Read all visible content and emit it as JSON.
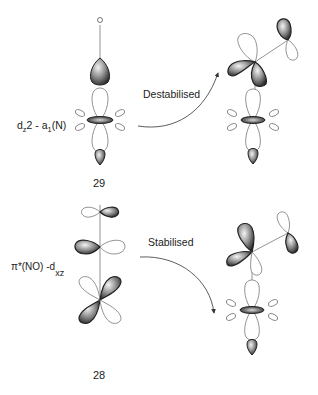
{
  "diagram": {
    "top": {
      "atom_label": "O",
      "orbital_label": {
        "main": "d",
        "main_sub": "z",
        "mid": "2 - a",
        "mid_sub": "1",
        "tail": "(N)"
      },
      "compound_number": "29",
      "arrow_label": "Destabilised"
    },
    "bottom": {
      "orbital_label": {
        "main": "π*(NO) -d",
        "main_sub": "xz"
      },
      "compound_number": "28",
      "arrow_label": "Stabilised"
    },
    "colors": {
      "line": "#6a6a6a",
      "lobe_dark": "#2a2a2a",
      "lobe_mid": "#8a8a8a",
      "lobe_light": "#f2f2f2",
      "background": "#ffffff"
    }
  }
}
